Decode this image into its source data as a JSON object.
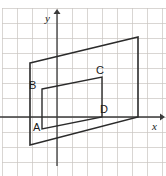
{
  "figure": {
    "background_color": "#ffffff",
    "stroke_color": "#2b2b2b",
    "grid_color": "#c9c4c0",
    "axis_color": "#3a3a3a",
    "axes": {
      "x_label": "x",
      "y_label": "y",
      "origin_px": {
        "x": 57,
        "y": 117
      },
      "x_axis_y_px": 117,
      "y_axis_x_px": 57,
      "x_axis_from_px": 0,
      "x_axis_to_px": 160,
      "y_axis_from_px": 166,
      "y_axis_to_px": 14
    },
    "grid": {
      "visible": true,
      "cell_px": 15,
      "x_lines_px": [
        2,
        17,
        32,
        47,
        57,
        72,
        87,
        102,
        117,
        132,
        147,
        162
      ],
      "y_lines_px": [
        8,
        23,
        38,
        53,
        68,
        83,
        98,
        117,
        132,
        147,
        162,
        176
      ]
    },
    "shapes": [
      {
        "name": "outer-parallelogram",
        "type": "parallelogram",
        "closed": true,
        "points_px": [
          [
            30,
            63
          ],
          [
            138,
            37
          ],
          [
            138,
            117
          ],
          [
            30,
            145
          ]
        ]
      },
      {
        "name": "inner-parallelogram",
        "type": "parallelogram",
        "closed": true,
        "points_px": [
          [
            42,
            89
          ],
          [
            102,
            77
          ],
          [
            102,
            117
          ],
          [
            42,
            129
          ]
        ]
      }
    ],
    "vertex_labels": [
      {
        "id": "A",
        "text": "A",
        "x_px": 33,
        "y_px": 131,
        "anchor": "start"
      },
      {
        "id": "B",
        "text": "B",
        "x_px": 29,
        "y_px": 89,
        "anchor": "start"
      },
      {
        "id": "C",
        "text": "C",
        "x_px": 96,
        "y_px": 74,
        "anchor": "start"
      },
      {
        "id": "D",
        "text": "D",
        "x_px": 100,
        "y_px": 113,
        "anchor": "start"
      }
    ],
    "axis_labels": [
      {
        "id": "y",
        "text": "y",
        "x_px": 45,
        "y_px": 22
      },
      {
        "id": "x",
        "text": "x",
        "x_px": 152,
        "y_px": 130
      }
    ]
  }
}
